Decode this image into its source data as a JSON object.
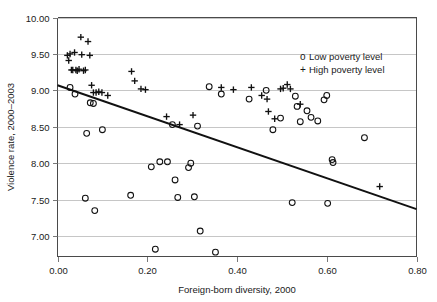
{
  "chart_data": {
    "type": "scatter",
    "title": "",
    "xlabel": "Foreign-born diversity, 2000",
    "ylabel": "Violence rate, 2000–2003",
    "xlim": [
      0.0,
      0.8
    ],
    "ylim": [
      6.72,
      10.0
    ],
    "xticks": [
      0.0,
      0.2,
      0.4,
      0.6,
      0.8
    ],
    "xtick_labels": [
      "0.00",
      "0.20",
      "0.40",
      "0.60",
      "0.80"
    ],
    "yticks": [
      7.0,
      7.5,
      8.0,
      8.5,
      9.0,
      9.5,
      10.0
    ],
    "ytick_labels": [
      "7.00",
      "7.50",
      "8.00",
      "8.50",
      "9.00",
      "9.50",
      "10.00"
    ],
    "grid": "horizontal",
    "legend_position": "upper-right",
    "legend": [
      {
        "marker": "o",
        "label": "Low poverty level"
      },
      {
        "marker": "+",
        "label": "High poverty level"
      }
    ],
    "trendline": {
      "type": "linear",
      "x_start": 0.0,
      "y_start": 9.07,
      "x_end": 0.8,
      "y_end": 7.37,
      "slope": -2.125,
      "intercept": 9.07
    },
    "series": [
      {
        "name": "Low poverty level",
        "marker": "o",
        "points": [
          [
            0.028,
            9.04
          ],
          [
            0.039,
            8.95
          ],
          [
            0.062,
            7.52
          ],
          [
            0.065,
            8.41
          ],
          [
            0.073,
            8.83
          ],
          [
            0.08,
            8.82
          ],
          [
            0.083,
            7.35
          ],
          [
            0.1,
            8.46
          ],
          [
            0.163,
            7.56
          ],
          [
            0.209,
            7.95
          ],
          [
            0.218,
            6.82
          ],
          [
            0.228,
            8.02
          ],
          [
            0.245,
            8.02
          ],
          [
            0.256,
            8.53
          ],
          [
            0.262,
            7.77
          ],
          [
            0.268,
            7.53
          ],
          [
            0.292,
            7.94
          ],
          [
            0.297,
            8.0
          ],
          [
            0.305,
            7.54
          ],
          [
            0.312,
            8.51
          ],
          [
            0.318,
            7.07
          ],
          [
            0.338,
            9.05
          ],
          [
            0.352,
            6.78
          ],
          [
            0.365,
            8.95
          ],
          [
            0.427,
            8.88
          ],
          [
            0.465,
            9.0
          ],
          [
            0.48,
            8.46
          ],
          [
            0.497,
            8.62
          ],
          [
            0.523,
            7.46
          ],
          [
            0.53,
            8.92
          ],
          [
            0.534,
            8.78
          ],
          [
            0.541,
            8.57
          ],
          [
            0.556,
            8.72
          ],
          [
            0.565,
            8.63
          ],
          [
            0.58,
            8.58
          ],
          [
            0.594,
            8.87
          ],
          [
            0.6,
            8.93
          ],
          [
            0.602,
            7.45
          ],
          [
            0.612,
            8.05
          ],
          [
            0.614,
            8.01
          ],
          [
            0.684,
            8.35
          ]
        ]
      },
      {
        "name": "High poverty level",
        "marker": "+",
        "points": [
          [
            0.022,
            9.48
          ],
          [
            0.025,
            9.41
          ],
          [
            0.028,
            9.5
          ],
          [
            0.031,
            9.28
          ],
          [
            0.034,
            9.28
          ],
          [
            0.038,
            9.52
          ],
          [
            0.041,
            9.28
          ],
          [
            0.044,
            9.27
          ],
          [
            0.048,
            9.29
          ],
          [
            0.052,
            9.73
          ],
          [
            0.054,
            9.49
          ],
          [
            0.058,
            9.27
          ],
          [
            0.062,
            9.28
          ],
          [
            0.068,
            9.67
          ],
          [
            0.072,
            9.48
          ],
          [
            0.076,
            9.07
          ],
          [
            0.08,
            8.97
          ],
          [
            0.086,
            8.97
          ],
          [
            0.092,
            8.98
          ],
          [
            0.099,
            8.97
          ],
          [
            0.112,
            8.93
          ],
          [
            0.165,
            9.26
          ],
          [
            0.172,
            9.13
          ],
          [
            0.186,
            9.02
          ],
          [
            0.196,
            9.01
          ],
          [
            0.243,
            8.64
          ],
          [
            0.272,
            8.53
          ],
          [
            0.302,
            8.66
          ],
          [
            0.365,
            9.04
          ],
          [
            0.392,
            9.01
          ],
          [
            0.432,
            9.04
          ],
          [
            0.455,
            8.93
          ],
          [
            0.467,
            8.88
          ],
          [
            0.47,
            8.71
          ],
          [
            0.484,
            8.61
          ],
          [
            0.497,
            9.02
          ],
          [
            0.503,
            9.03
          ],
          [
            0.512,
            9.08
          ],
          [
            0.519,
            9.02
          ],
          [
            0.541,
            8.81
          ],
          [
            0.718,
            7.68
          ]
        ]
      }
    ]
  }
}
